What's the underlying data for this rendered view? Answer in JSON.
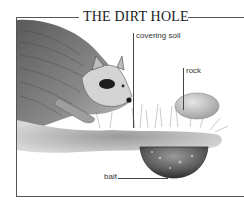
{
  "title": "THE DIRT HOLE",
  "labels": {
    "covering_soil": "covering soil",
    "rock": "rock",
    "bait": "bait"
  },
  "colors": {
    "frame": "#555555",
    "ink": "#1a1a1a",
    "fur_dark": "#4a4a4a",
    "fur_light": "#a8a8a8",
    "mask": "#1e1e1e",
    "soil": "#8c8c8c",
    "background": "#ffffff"
  }
}
